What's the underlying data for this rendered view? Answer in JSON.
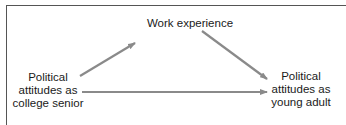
{
  "diagram": {
    "nodes": [
      {
        "id": "work",
        "lines": [
          "Work experience"
        ]
      },
      {
        "id": "senior",
        "lines": [
          "Political",
          "attitudes as",
          "college senior"
        ]
      },
      {
        "id": "adult",
        "lines": [
          "Political",
          "attitudes as",
          "young adult"
        ]
      }
    ],
    "edges": [
      {
        "from": "senior",
        "to": "work"
      },
      {
        "from": "work",
        "to": "adult"
      },
      {
        "from": "senior",
        "to": "adult"
      }
    ],
    "colors": {
      "arrow": "#8a8a8a",
      "border": "#555555",
      "text": "#1a1a1a"
    }
  }
}
